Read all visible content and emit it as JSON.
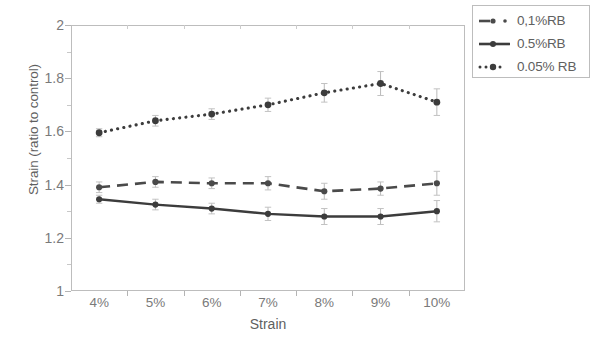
{
  "chart_data": {
    "type": "line",
    "title": "",
    "subtitle": "",
    "xlabel": "Strain",
    "ylabel": "Strain (ratio to control)",
    "categories": [
      "4%",
      "5%",
      "6%",
      "7%",
      "8%",
      "9%",
      "10%"
    ],
    "x_tick_labels": [
      "4%",
      "5%",
      "6%",
      "7%",
      "8%",
      "9%",
      "10%"
    ],
    "y_tick_labels": [
      "2",
      "1.8",
      "1.6",
      "1.4",
      "1.2",
      "1"
    ],
    "y_tick_values": [
      2,
      1.8,
      1.6,
      1.4,
      1.2,
      1
    ],
    "ylim": [
      1,
      2
    ],
    "grid": false,
    "legend_position": "top-right outside",
    "series": [
      {
        "name": "0,1%RB",
        "style": "dashed",
        "marker": "circle",
        "color": "#4a4a4a",
        "values": [
          1.39,
          1.41,
          1.405,
          1.405,
          1.375,
          1.385,
          1.405
        ],
        "errors": [
          0.02,
          0.02,
          0.02,
          0.025,
          0.03,
          0.025,
          0.045
        ]
      },
      {
        "name": "0.5%RB",
        "style": "solid",
        "marker": "circle",
        "color": "#3c3c3c",
        "values": [
          1.345,
          1.325,
          1.31,
          1.29,
          1.28,
          1.28,
          1.3
        ],
        "errors": [
          0.015,
          0.02,
          0.02,
          0.025,
          0.03,
          0.03,
          0.04
        ]
      },
      {
        "name": "0.05% RB",
        "style": "dotted",
        "marker": "circle",
        "color": "#3c3c3c",
        "values": [
          1.595,
          1.64,
          1.665,
          1.7,
          1.745,
          1.78,
          1.71
        ],
        "errors": [
          0.015,
          0.02,
          0.02,
          0.025,
          0.035,
          0.045,
          0.05
        ]
      }
    ]
  },
  "axes": {
    "y_title": "Strain (ratio to control)",
    "x_title": "Strain",
    "y_ticks": [
      "2",
      "1.8",
      "1.6",
      "1.4",
      "1.2",
      "1"
    ],
    "x_ticks": [
      "4%",
      "5%",
      "6%",
      "7%",
      "8%",
      "9%",
      "10%"
    ]
  },
  "legend": {
    "items": [
      {
        "label": "0,1%RB",
        "style": "dashed"
      },
      {
        "label": "0.5%RB",
        "style": "solid"
      },
      {
        "label": "0.05% RB",
        "style": "dotted"
      }
    ]
  },
  "colors": {
    "series_dark": "#3c3c3c",
    "frame": "#bdbdbd",
    "text": "#6d6d6d"
  }
}
